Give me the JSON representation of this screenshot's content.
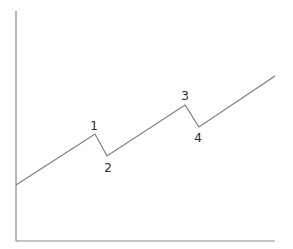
{
  "chart_data": {
    "type": "line",
    "title": "",
    "xlabel": "",
    "ylabel": "",
    "grid": false,
    "legend": null,
    "points": [
      {
        "x": 16,
        "y": 185,
        "label": ""
      },
      {
        "x": 95,
        "y": 134,
        "label": "1"
      },
      {
        "x": 107,
        "y": 156,
        "label": "2"
      },
      {
        "x": 185,
        "y": 105,
        "label": "3"
      },
      {
        "x": 199,
        "y": 127,
        "label": "4"
      },
      {
        "x": 275,
        "y": 76,
        "label": ""
      }
    ],
    "labels": [
      {
        "text": "1",
        "x": 94,
        "y": 130
      },
      {
        "text": "2",
        "x": 108,
        "y": 172
      },
      {
        "text": "3",
        "x": 185,
        "y": 100
      },
      {
        "text": "4",
        "x": 198,
        "y": 142
      }
    ],
    "axes": {
      "origin": {
        "x": 16,
        "y": 241
      },
      "y_top": 11,
      "x_end": 275
    }
  },
  "colors": {
    "line": "#7d7d7d",
    "axis": "#8a8a8a",
    "label": "#2b2b2b",
    "background": "#ffffff"
  }
}
